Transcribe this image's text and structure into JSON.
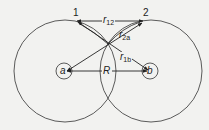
{
  "diagram": {
    "electrons": [
      {
        "label": "1",
        "x": 77,
        "y": 21
      },
      {
        "label": "2",
        "x": 143,
        "y": 21
      }
    ],
    "nuclei": [
      {
        "label": "a",
        "x": 66,
        "y": 71
      },
      {
        "label": "b",
        "x": 150,
        "y": 71
      }
    ],
    "distances": {
      "r12": {
        "symbol": "r",
        "sub": "12"
      },
      "r2a": {
        "symbol": "r",
        "sub": "2a"
      },
      "r1b": {
        "symbol": "r",
        "sub": "1b"
      },
      "R": {
        "symbol": "R"
      }
    },
    "colors": {
      "line": "#222222",
      "background": "#f2f2f0"
    }
  }
}
